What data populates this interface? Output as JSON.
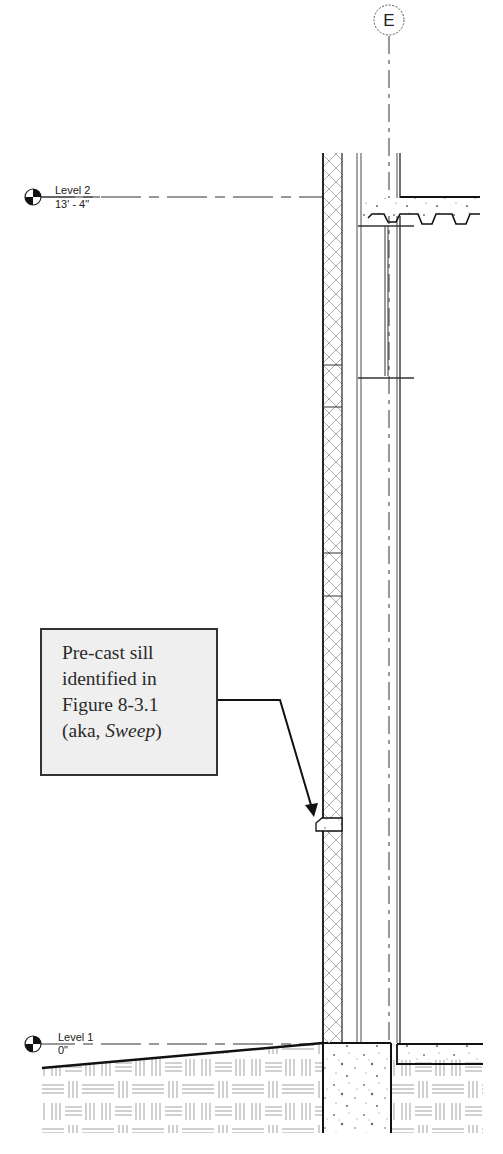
{
  "gridline": {
    "label": "E"
  },
  "levels": [
    {
      "name": "Level 2",
      "elevation": "13' - 4\""
    },
    {
      "name": "Level 1",
      "elevation": "0\""
    }
  ],
  "callout": {
    "line1": "Pre-cast sill",
    "line2": "identified in",
    "line3": "Figure 8-3.1",
    "line4_prefix": "(aka, ",
    "line4_italic": "Sweep",
    "line4_suffix": ")"
  },
  "colors": {
    "line": "#222222",
    "callout_fill": "#efefef",
    "hatch": "#9a9a9a"
  }
}
